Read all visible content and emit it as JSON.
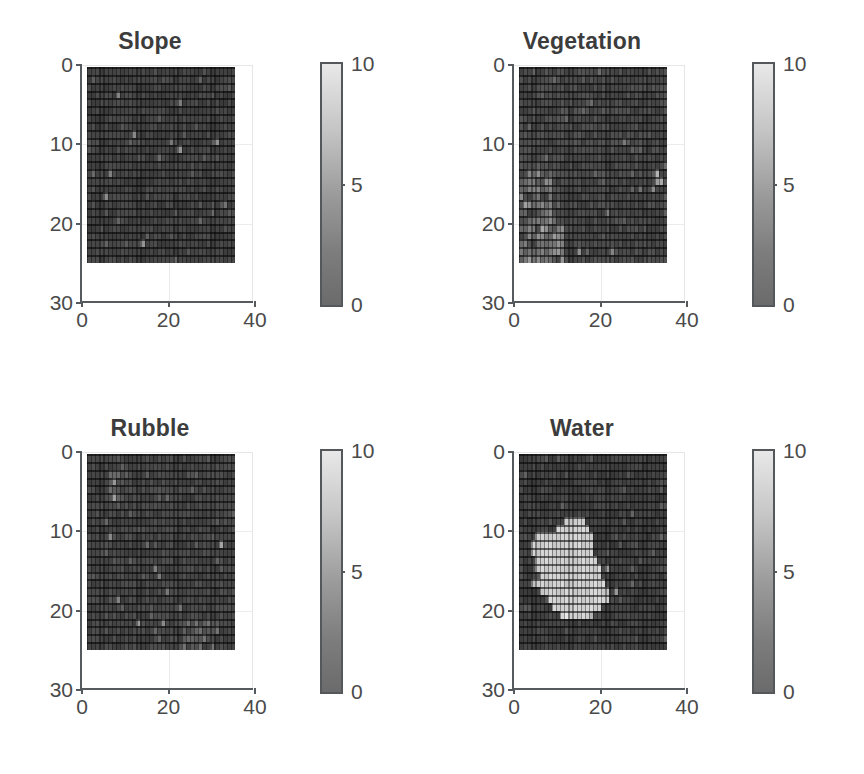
{
  "figure": {
    "layout": "2x2 subplot grid",
    "background": "#ffffff",
    "width": 864,
    "height": 774
  },
  "panels": [
    {
      "title": "Slope",
      "key": "slope"
    },
    {
      "title": "Vegetation",
      "key": "vegetation"
    },
    {
      "title": "Rubble",
      "key": "rubble"
    },
    {
      "title": "Water",
      "key": "water"
    }
  ],
  "axis": {
    "xticks": [
      "0",
      "20",
      "40"
    ],
    "yticks": [
      "0",
      "10",
      "20",
      "30"
    ],
    "xlim": [
      0,
      40
    ],
    "ylim": [
      0,
      30
    ],
    "y_inverted": true
  },
  "colorbar": {
    "ticks": [
      "10",
      "5",
      "0"
    ],
    "min": 0,
    "max": 10,
    "colormap": "gray",
    "low_color": "#6b6b6b",
    "high_color": "#e8e8e8",
    "orientation": "vertical"
  },
  "chart_data": [
    {
      "type": "heatmap",
      "title": "Slope",
      "xlabel": "",
      "ylabel": "",
      "xlim": [
        0,
        40
      ],
      "ylim": [
        0,
        30
      ],
      "xticks": [
        0,
        20,
        40
      ],
      "yticks": [
        0,
        10,
        20,
        30
      ],
      "grid": true,
      "colorbar": {
        "min": 0,
        "max": 10,
        "ticks": [
          0,
          5,
          10
        ],
        "colormap": "gray"
      },
      "rows": 25,
      "cols": 36,
      "data_extent_x": [
        0,
        36
      ],
      "data_extent_y": [
        0,
        25
      ],
      "value_range": [
        0.2,
        6.5
      ],
      "mean_value": 1.4,
      "description": "Low-value speckled noise field; sparse brighter isolated cells scattered throughout, slightly brighter band near rows 8-14.",
      "seed": 11,
      "base": 1.3,
      "noise": 1.0,
      "hotspots": [
        {
          "r": 3,
          "c": 7,
          "v": 5.0
        },
        {
          "r": 4,
          "c": 22,
          "v": 4.6
        },
        {
          "r": 8,
          "c": 11,
          "v": 5.2
        },
        {
          "r": 9,
          "c": 20,
          "v": 4.4
        },
        {
          "r": 9,
          "c": 31,
          "v": 5.6
        },
        {
          "r": 10,
          "c": 22,
          "v": 5.9
        },
        {
          "r": 13,
          "c": 5,
          "v": 4.8
        },
        {
          "r": 16,
          "c": 4,
          "v": 5.4
        },
        {
          "r": 17,
          "c": 33,
          "v": 4.2
        },
        {
          "r": 22,
          "c": 13,
          "v": 5.8
        },
        {
          "r": 11,
          "c": 17,
          "v": 3.9
        },
        {
          "r": 19,
          "c": 27,
          "v": 3.6
        }
      ]
    },
    {
      "type": "heatmap",
      "title": "Vegetation",
      "xlabel": "",
      "ylabel": "",
      "xlim": [
        0,
        40
      ],
      "ylim": [
        0,
        30
      ],
      "xticks": [
        0,
        20,
        40
      ],
      "yticks": [
        0,
        10,
        20,
        30
      ],
      "grid": true,
      "colorbar": {
        "min": 0,
        "max": 10,
        "ticks": [
          0,
          5,
          10
        ],
        "colormap": "gray"
      },
      "rows": 25,
      "cols": 36,
      "data_extent_x": [
        0,
        36
      ],
      "data_extent_y": [
        0,
        25
      ],
      "value_range": [
        0.2,
        7.5
      ],
      "mean_value": 1.9,
      "description": "Noisy low field with a clearly brighter cluster along the left edge from row 13 down to row 24, plus a bright patch near column 33-34 around rows 14-15.",
      "seed": 23,
      "base": 1.5,
      "noise": 1.2,
      "regions": [
        {
          "r0": 13,
          "r1": 24,
          "c0": 0,
          "c1": 7,
          "v": 4.6
        },
        {
          "r0": 19,
          "r1": 24,
          "c0": 2,
          "c1": 10,
          "v": 5.2
        },
        {
          "r0": 14,
          "r1": 15,
          "c0": 32,
          "c1": 34,
          "v": 7.2
        }
      ],
      "hotspots": [
        {
          "r": 17,
          "c": 1,
          "v": 6.4
        },
        {
          "r": 20,
          "c": 5,
          "v": 6.8
        },
        {
          "r": 23,
          "c": 14,
          "v": 5.6
        },
        {
          "r": 23,
          "c": 22,
          "v": 5.0
        },
        {
          "r": 9,
          "c": 25,
          "v": 4.6
        },
        {
          "r": 18,
          "c": 21,
          "v": 4.8
        },
        {
          "r": 13,
          "c": 33,
          "v": 7.4
        },
        {
          "r": 14,
          "c": 34,
          "v": 7.0
        }
      ]
    },
    {
      "type": "heatmap",
      "title": "Rubble",
      "xlabel": "",
      "ylabel": "",
      "xlim": [
        0,
        40
      ],
      "ylim": [
        0,
        30
      ],
      "xticks": [
        0,
        20,
        40
      ],
      "yticks": [
        0,
        10,
        20,
        30
      ],
      "grid": true,
      "colorbar": {
        "min": 0,
        "max": 10,
        "ticks": [
          0,
          5,
          10
        ],
        "colormap": "gray"
      },
      "rows": 25,
      "cols": 36,
      "data_extent_x": [
        0,
        36
      ],
      "data_extent_y": [
        0,
        25
      ],
      "value_range": [
        0.2,
        6.8
      ],
      "mean_value": 1.6,
      "description": "Noisy low field with small brighter blobs near upper-left (rows 2-5, cols 5-8), a bright cell near row 11 col 32, and brighter streaks in the lower band rows 20-24.",
      "seed": 37,
      "base": 1.4,
      "noise": 1.1,
      "regions": [
        {
          "r0": 21,
          "r1": 24,
          "c0": 23,
          "c1": 31,
          "v": 3.6
        },
        {
          "r0": 2,
          "r1": 5,
          "c0": 5,
          "c1": 8,
          "v": 3.4
        }
      ],
      "hotspots": [
        {
          "r": 3,
          "c": 6,
          "v": 6.0
        },
        {
          "r": 5,
          "c": 6,
          "v": 6.4
        },
        {
          "r": 10,
          "c": 5,
          "v": 5.2
        },
        {
          "r": 11,
          "c": 32,
          "v": 6.6
        },
        {
          "r": 14,
          "c": 16,
          "v": 4.8
        },
        {
          "r": 15,
          "c": 17,
          "v": 4.6
        },
        {
          "r": 17,
          "c": 19,
          "v": 4.4
        },
        {
          "r": 18,
          "c": 7,
          "v": 5.0
        },
        {
          "r": 21,
          "c": 12,
          "v": 6.2
        },
        {
          "r": 21,
          "c": 18,
          "v": 5.4
        },
        {
          "r": 19,
          "c": 22,
          "v": 4.2
        },
        {
          "r": 24,
          "c": 27,
          "v": 4.0
        }
      ]
    },
    {
      "type": "heatmap",
      "title": "Water",
      "xlabel": "",
      "ylabel": "",
      "xlim": [
        0,
        40
      ],
      "ylim": [
        0,
        30
      ],
      "xticks": [
        0,
        20,
        40
      ],
      "yticks": [
        0,
        10,
        20,
        30
      ],
      "grid": true,
      "colorbar": {
        "min": 0,
        "max": 10,
        "ticks": [
          0,
          5,
          10
        ],
        "colormap": "gray"
      },
      "rows": 25,
      "cols": 36,
      "data_extent_x": [
        0,
        36
      ],
      "data_extent_y": [
        0,
        25
      ],
      "value_range": [
        0.2,
        10
      ],
      "mean_value": 2.3,
      "description": "Dark noise background with one large contiguous bright lake-shaped blob spanning roughly rows 8-20 and columns 3-22, widest near rows 11-18, tapering toward the bottom-right.",
      "seed": 53,
      "base": 1.2,
      "noise": 1.0,
      "blob_value": 9.4,
      "blob_rows": [
        {
          "r": 8,
          "c0": 11,
          "c1": 15
        },
        {
          "r": 9,
          "c0": 9,
          "c1": 16
        },
        {
          "r": 10,
          "c0": 4,
          "c1": 17
        },
        {
          "r": 11,
          "c0": 3,
          "c1": 17
        },
        {
          "r": 12,
          "c0": 3,
          "c1": 17
        },
        {
          "r": 13,
          "c0": 4,
          "c1": 18
        },
        {
          "r": 14,
          "c0": 4,
          "c1": 19
        },
        {
          "r": 15,
          "c0": 5,
          "c1": 19
        },
        {
          "r": 16,
          "c0": 3,
          "c1": 20
        },
        {
          "r": 17,
          "c0": 5,
          "c1": 21
        },
        {
          "r": 18,
          "c0": 7,
          "c1": 21
        },
        {
          "r": 19,
          "c0": 8,
          "c1": 19
        },
        {
          "r": 20,
          "c0": 10,
          "c1": 17
        }
      ],
      "hotspots": [
        {
          "r": 14,
          "c": 21,
          "v": 6.2
        },
        {
          "r": 17,
          "c": 23,
          "v": 6.0
        },
        {
          "r": 20,
          "c": 11,
          "v": 10.0
        },
        {
          "r": 20,
          "c": 17,
          "v": 7.4
        },
        {
          "r": 16,
          "c": 3,
          "v": 8.0
        }
      ]
    }
  ]
}
